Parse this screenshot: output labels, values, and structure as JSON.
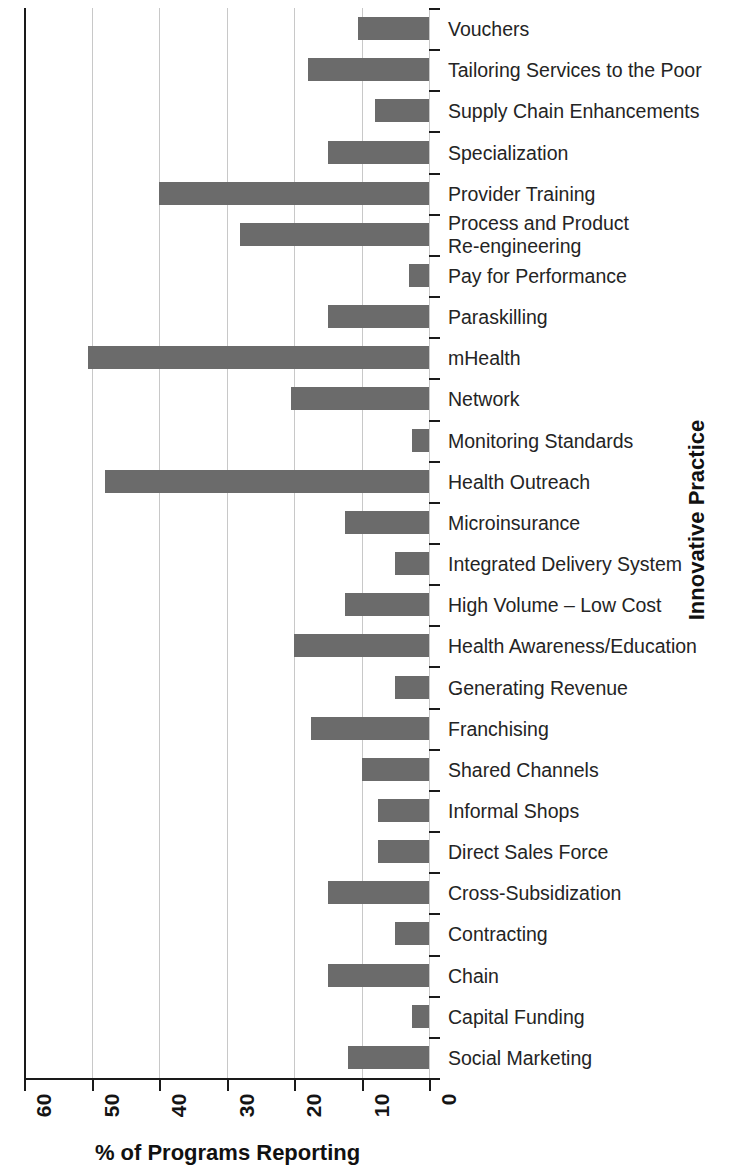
{
  "chart_data": {
    "type": "bar",
    "orientation": "horizontal",
    "title": "",
    "xlabel": "% of Programs Reporting",
    "ylabel": "Innovative Practice",
    "xlim": [
      60,
      0
    ],
    "x_axis_reversed": true,
    "xticks": [
      60,
      50,
      40,
      30,
      20,
      10,
      0
    ],
    "xtick_labels": [
      "60",
      "50",
      "40",
      "30",
      "20",
      "10",
      "0"
    ],
    "grid": "vertical",
    "legend": null,
    "bar_color": "#6b6b6b",
    "categories": [
      "Vouchers",
      "Tailoring Services to the Poor",
      "Supply Chain Enhancements",
      "Specialization",
      "Provider Training",
      "Process and Product\nRe-engineering",
      "Pay for Performance",
      "Paraskilling",
      "mHealth",
      "Network",
      "Monitoring Standards",
      "Health Outreach",
      "Microinsurance",
      "Integrated Delivery System",
      "High Volume – Low Cost",
      "Health Awareness/Education",
      "Generating Revenue",
      "Franchising",
      "Shared Channels",
      "Informal Shops",
      "Direct Sales Force",
      "Cross-Subsidization",
      "Contracting",
      "Chain",
      "Capital Funding",
      "Social Marketing"
    ],
    "values": [
      10.5,
      18,
      8,
      15,
      40,
      28,
      3,
      15,
      50.5,
      20.5,
      2.5,
      48,
      12.5,
      5,
      12.5,
      20,
      5,
      17.5,
      10,
      7.5,
      7.5,
      15,
      5,
      15,
      2.5,
      12
    ]
  }
}
